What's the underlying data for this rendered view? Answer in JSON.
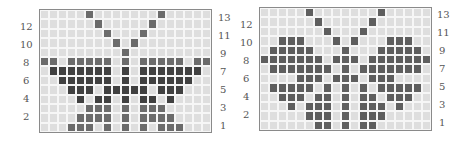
{
  "colors": {
    "empty": "#dedede",
    "gridline": "#f6f6f6",
    "medium": "#6b6b6b",
    "dark": "#404040",
    "right_fill": "#5e5e5e",
    "border": "#8a8a8a"
  },
  "charts": [
    {
      "name": "left-pattern",
      "columns": 19,
      "rows": 13,
      "left_labels": [
        "12",
        "10",
        "8",
        "6",
        "4",
        "2"
      ],
      "right_labels": [
        "13",
        "11",
        "9",
        "7",
        "5",
        "3",
        "1"
      ],
      "filled_rows": {
        "13": [
          6,
          14
        ],
        "12": [
          7,
          13
        ],
        "11": [
          8,
          12
        ],
        "10": [
          9,
          11
        ],
        "9": [
          10
        ],
        "8": [
          1,
          2,
          4,
          5,
          6,
          7,
          8,
          10,
          12,
          13,
          14,
          15,
          16,
          18,
          19
        ],
        "7": [
          2,
          3,
          4,
          5,
          6,
          7,
          8,
          10,
          12,
          13,
          14,
          15,
          16,
          17,
          18
        ],
        "6": [
          3,
          4,
          5,
          6,
          7,
          8,
          10,
          12,
          13,
          14,
          15,
          16,
          17
        ],
        "5": [
          4,
          5,
          6,
          8,
          9,
          10,
          11,
          12,
          14,
          15,
          16
        ],
        "4": [
          5,
          7,
          8,
          10,
          12,
          13,
          15
        ],
        "3": [
          6,
          7,
          8,
          10,
          12,
          13,
          14
        ],
        "2": [
          5,
          6,
          7,
          8,
          10,
          12,
          13,
          14,
          15
        ],
        "1": [
          4,
          5,
          6,
          8,
          10,
          12,
          14,
          15,
          16
        ]
      },
      "dark_rows": [
        "7",
        "6",
        "5",
        "4"
      ]
    },
    {
      "name": "right-pattern",
      "columns": 19,
      "rows": 13,
      "left_labels": [
        "12",
        "10",
        "8",
        "6",
        "4",
        "2"
      ],
      "right_labels": [
        "13",
        "11",
        "9",
        "7",
        "5",
        "3",
        "1"
      ],
      "filled_rows": {
        "13": [
          6,
          14
        ],
        "12": [
          7,
          13
        ],
        "11": [
          8,
          12
        ],
        "10": [
          3,
          4,
          5,
          9,
          11,
          15,
          16,
          17
        ],
        "9": [
          2,
          3,
          4,
          5,
          6,
          10,
          14,
          15,
          16,
          17,
          18
        ],
        "8": [
          1,
          2,
          3,
          4,
          5,
          6,
          7,
          9,
          10,
          11,
          13,
          14,
          15,
          16,
          17,
          18,
          19
        ],
        "7": [
          2,
          3,
          4,
          5,
          6,
          7,
          8,
          10,
          12,
          13,
          14,
          15,
          16,
          17,
          18
        ],
        "6": [
          5,
          6,
          7,
          9,
          10,
          11,
          13,
          14,
          15
        ],
        "5": [
          2,
          3,
          4,
          5,
          6,
          8,
          10,
          12,
          14,
          15,
          16,
          17,
          18
        ],
        "4": [
          3,
          4,
          5,
          7,
          8,
          10,
          12,
          13,
          15,
          16,
          17
        ],
        "3": [
          4,
          6,
          7,
          8,
          10,
          12,
          13,
          14,
          16
        ],
        "2": [
          6,
          7,
          8,
          10,
          12,
          13,
          14
        ],
        "1": [
          7,
          8,
          10,
          12,
          13
        ]
      },
      "dark_rows": []
    }
  ]
}
